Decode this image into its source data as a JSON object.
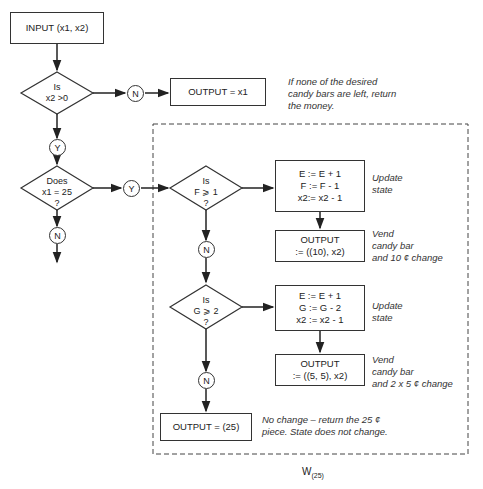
{
  "input_box": {
    "label": "INPUT (x1, x2)"
  },
  "decision_x2": {
    "line1": "Is",
    "line2": "x2 >0"
  },
  "output_x1": {
    "label": "OUTPUT = x1"
  },
  "note_return": {
    "line1": "If none of the desired",
    "line2": "candy bars are left, return",
    "line3": "the money."
  },
  "decision_x1": {
    "line1": "Does",
    "line2": "x1 = 25",
    "line3": "?"
  },
  "decision_f": {
    "line1": "Is",
    "line2": "F ⩾ 1",
    "line3": "?"
  },
  "update_f": {
    "line1": "E := E + 1",
    "line2": "F := F - 1",
    "line3": "x2:= x2 - 1"
  },
  "note_update1": {
    "line1": "Update",
    "line2": "state"
  },
  "output_10": {
    "line1": "OUTPUT",
    "line2": ":= ((10), x2)"
  },
  "note_vend1": {
    "line1": "Vend",
    "line2": "candy bar",
    "line3": "and 10 ¢ change"
  },
  "decision_g": {
    "line1": "Is",
    "line2": "G ⩾ 2",
    "line3": "?"
  },
  "update_g": {
    "line1": "E := E + 1",
    "line2": "G := G - 2",
    "line3": "x2 := x2 - 1"
  },
  "note_update2": {
    "line1": "Update",
    "line2": "state"
  },
  "output_55": {
    "line1": "OUTPUT",
    "line2": ":= ((5, 5), x2)"
  },
  "note_vend2": {
    "line1": "Vend",
    "line2": "candy bar",
    "line3": "and 2 x 5 ¢ change"
  },
  "output_25": {
    "label": "OUTPUT = (25)"
  },
  "note_nochange": {
    "line1": "No change – return the 25 ¢",
    "line2": "piece. State does not change."
  },
  "connectors": {
    "n": "N",
    "y": "Y"
  },
  "caption": {
    "main": "W",
    "sub": "(25)"
  }
}
